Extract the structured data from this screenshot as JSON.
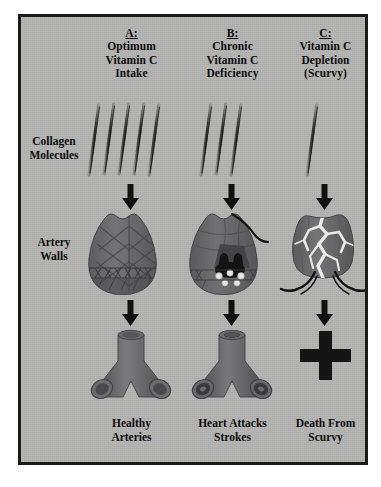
{
  "figure": {
    "title_row_labels": {
      "collagen": "Collagen\nMolecules",
      "artery": "Artery\nWalls"
    },
    "row_labels": [
      {
        "name": "collagen-molecules",
        "line1": "Collagen",
        "line2": "Molecules"
      },
      {
        "name": "artery-walls",
        "line1": "Artery",
        "line2": "Walls"
      }
    ],
    "columns": [
      {
        "id": "A",
        "letter": "A:",
        "heading_lines": [
          "Optimum",
          "Vitamin C",
          "Intake"
        ],
        "collagen_strand_count": 5,
        "artery_state": "intact cross-linked collagen mesh",
        "vessel_state": "open patent branching artery",
        "outcome_lines": [
          "Healthy",
          "Arteries"
        ]
      },
      {
        "id": "B",
        "letter": "B:",
        "heading_lines": [
          "Chronic",
          "Vitamin C",
          "Deficiency"
        ],
        "collagen_strand_count": 3,
        "artery_state": "weakened wall with plaque deposits",
        "vessel_state": "narrowed occluded branching artery",
        "outcome_lines": [
          "Heart Attacks",
          "Strokes"
        ]
      },
      {
        "id": "C",
        "letter": "C:",
        "heading_lines": [
          "Vitamin C",
          "Depletion",
          "(Scurvy)"
        ],
        "collagen_strand_count": 1,
        "artery_state": "ruptured wall with fissures and bleeding",
        "vessel_state": "death cross symbol",
        "outcome_lines": [
          "Death From",
          "Scurvy"
        ]
      }
    ],
    "colors": {
      "background": "#b4b4b2",
      "frame": "#1b1b1b",
      "tissue": "#6f6f70",
      "tissue_dark": "#4e4e50",
      "text": "#0d0d0d",
      "arrow": "#111111",
      "fissure": "#e8e8e6",
      "plaque": "#1a1a1a"
    }
  }
}
